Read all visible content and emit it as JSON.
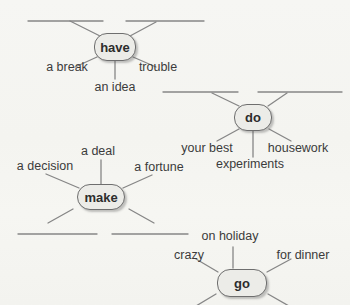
{
  "diagram": {
    "type": "collocation-word-map",
    "colors": {
      "background": "#f5f5f1",
      "line": "#868686",
      "node_fill": "#ecece8",
      "node_border": "#6e6e6e",
      "node_text": "#2d2d2d",
      "label_text": "#3b3b3b"
    },
    "clusters": [
      {
        "verb": "have",
        "spokes": [
          {
            "type": "blank",
            "position": "top-left",
            "label": ""
          },
          {
            "type": "blank",
            "position": "top-right",
            "label": ""
          },
          {
            "type": "word",
            "position": "lower-left",
            "label": "a break"
          },
          {
            "type": "word",
            "position": "lower-right",
            "label": "trouble"
          },
          {
            "type": "word",
            "position": "bottom",
            "label": "an idea"
          }
        ]
      },
      {
        "verb": "do",
        "spokes": [
          {
            "type": "blank",
            "position": "top-left",
            "label": ""
          },
          {
            "type": "blank",
            "position": "top-right",
            "label": ""
          },
          {
            "type": "word",
            "position": "lower-left",
            "label": "your best"
          },
          {
            "type": "word",
            "position": "lower-right",
            "label": "housework"
          },
          {
            "type": "word",
            "position": "bottom",
            "label": "experiments"
          }
        ]
      },
      {
        "verb": "make",
        "spokes": [
          {
            "type": "word",
            "position": "top",
            "label": "a deal"
          },
          {
            "type": "word",
            "position": "upper-left",
            "label": "a decision"
          },
          {
            "type": "word",
            "position": "upper-right",
            "label": "a fortune"
          },
          {
            "type": "blank",
            "position": "bottom-left",
            "label": ""
          },
          {
            "type": "blank",
            "position": "bottom-right",
            "label": ""
          }
        ]
      },
      {
        "verb": "go",
        "spokes": [
          {
            "type": "word",
            "position": "top",
            "label": "on holiday"
          },
          {
            "type": "word",
            "position": "upper-left",
            "label": "crazy"
          },
          {
            "type": "word",
            "position": "upper-right",
            "label": "for dinner"
          },
          {
            "type": "blank",
            "position": "bottom-left",
            "label": ""
          },
          {
            "type": "blank",
            "position": "bottom-right",
            "label": ""
          }
        ]
      }
    ]
  }
}
